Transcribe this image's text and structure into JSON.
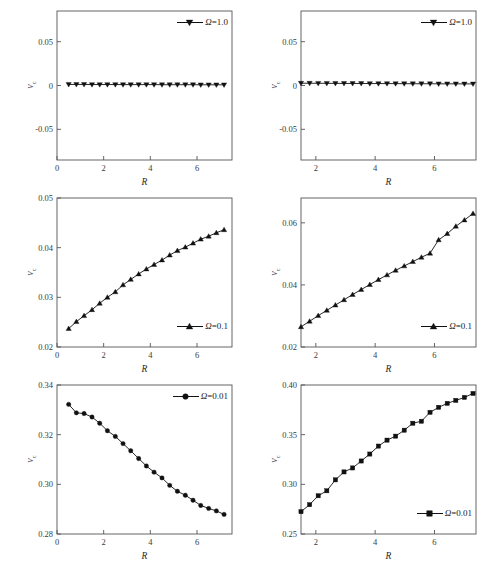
{
  "figure": {
    "panel_count": 6,
    "columns": 2,
    "rows": 3
  },
  "axes": {
    "xlabel": "R",
    "ylabel_main": "v",
    "ylabel_sub": "c"
  },
  "chart_data": [
    {
      "id": "top-left",
      "type": "line",
      "title": "",
      "xlabel": "R",
      "ylabel": "v_c",
      "xlim": [
        0,
        7.5
      ],
      "ylim": [
        -0.085,
        0.085
      ],
      "xticks": [
        0,
        2,
        4,
        6
      ],
      "xticklabels": [
        "0",
        "2",
        "4",
        "6"
      ],
      "yticks": [
        -0.05,
        0,
        0.05
      ],
      "yticklabels": [
        "-0.05",
        "0",
        "0.05"
      ],
      "grid": false,
      "legend_position": "top-right",
      "series": [
        {
          "name": "Ω=1.0",
          "marker": "triangle-down",
          "x": [
            0.5,
            0.83,
            1.16,
            1.5,
            1.83,
            2.16,
            2.5,
            2.83,
            3.16,
            3.5,
            3.83,
            4.16,
            4.5,
            4.83,
            5.16,
            5.5,
            5.83,
            6.16,
            6.5,
            6.83,
            7.16
          ],
          "y": [
            0.0012,
            0.0012,
            0.0012,
            0.0011,
            0.0011,
            0.0011,
            0.0011,
            0.001,
            0.001,
            0.001,
            0.001,
            0.001,
            0.0009,
            0.0009,
            0.0009,
            0.0009,
            0.0009,
            0.0008,
            0.0008,
            0.0008,
            0.0008
          ]
        }
      ]
    },
    {
      "id": "top-right",
      "type": "line",
      "title": "",
      "xlabel": "R",
      "ylabel": "v_c",
      "xlim": [
        1.5,
        7.4
      ],
      "ylim": [
        -0.085,
        0.085
      ],
      "xticks": [
        2,
        4,
        6
      ],
      "xticklabels": [
        "2",
        "4",
        "6"
      ],
      "yticks": [
        -0.05,
        0,
        0.05
      ],
      "yticklabels": [
        "-0.05",
        "0",
        "0.05"
      ],
      "grid": false,
      "legend_position": "top-right",
      "series": [
        {
          "name": "Ω=1.0",
          "marker": "triangle-down",
          "x": [
            1.5,
            1.79,
            2.08,
            2.37,
            2.66,
            2.95,
            3.24,
            3.53,
            3.82,
            4.11,
            4.4,
            4.69,
            4.98,
            5.27,
            5.56,
            5.85,
            6.14,
            6.43,
            6.72,
            7.01,
            7.3
          ],
          "y": [
            0.0026,
            0.0026,
            0.0025,
            0.0025,
            0.0024,
            0.0024,
            0.0023,
            0.0023,
            0.0022,
            0.0022,
            0.0022,
            0.0021,
            0.0021,
            0.002,
            0.002,
            0.002,
            0.0019,
            0.0019,
            0.0019,
            0.0018,
            0.0018
          ]
        }
      ]
    },
    {
      "id": "middle-left",
      "type": "line",
      "title": "",
      "xlabel": "R",
      "ylabel": "v_c",
      "xlim": [
        0,
        7.5
      ],
      "ylim": [
        0.02,
        0.05
      ],
      "xticks": [
        0,
        2,
        4,
        6
      ],
      "xticklabels": [
        "0",
        "2",
        "4",
        "6"
      ],
      "yticks": [
        0.02,
        0.03,
        0.04,
        0.05
      ],
      "yticklabels": [
        "0.02",
        "0.03",
        "0.04",
        "0.05"
      ],
      "grid": false,
      "legend_position": "bottom-right",
      "series": [
        {
          "name": "Ω=0.1",
          "marker": "triangle-up",
          "x": [
            0.5,
            0.83,
            1.16,
            1.5,
            1.83,
            2.16,
            2.5,
            2.83,
            3.16,
            3.5,
            3.83,
            4.16,
            4.5,
            4.83,
            5.16,
            5.5,
            5.83,
            6.16,
            6.5,
            6.83,
            7.16
          ],
          "y": [
            0.0237,
            0.0251,
            0.0263,
            0.0275,
            0.0288,
            0.03,
            0.0311,
            0.0325,
            0.0336,
            0.0347,
            0.0357,
            0.0366,
            0.0375,
            0.0385,
            0.0394,
            0.0401,
            0.0409,
            0.0417,
            0.0423,
            0.043,
            0.0436
          ]
        }
      ]
    },
    {
      "id": "middle-right",
      "type": "line",
      "title": "",
      "xlabel": "R",
      "ylabel": "v_c",
      "xlim": [
        1.5,
        7.4
      ],
      "ylim": [
        0.02,
        0.068
      ],
      "xticks": [
        2,
        4,
        6
      ],
      "xticklabels": [
        "2",
        "4",
        "6"
      ],
      "yticks": [
        0.02,
        0.04,
        0.06
      ],
      "yticklabels": [
        "0.02",
        "0.04",
        "0.06"
      ],
      "grid": false,
      "legend_position": "bottom-right",
      "series": [
        {
          "name": "Ω=0.1",
          "marker": "triangle-up",
          "x": [
            1.5,
            1.79,
            2.08,
            2.37,
            2.66,
            2.95,
            3.24,
            3.53,
            3.82,
            4.11,
            4.4,
            4.69,
            4.98,
            5.27,
            5.56,
            5.85,
            6.14,
            6.43,
            6.72,
            7.01,
            7.3
          ],
          "y": [
            0.0265,
            0.0283,
            0.0301,
            0.0318,
            0.0335,
            0.0352,
            0.0369,
            0.0385,
            0.0401,
            0.0417,
            0.0432,
            0.0447,
            0.0461,
            0.0475,
            0.0489,
            0.0502,
            0.0545,
            0.0565,
            0.0589,
            0.0609,
            0.063
          ]
        }
      ]
    },
    {
      "id": "bottom-left",
      "type": "line",
      "title": "",
      "xlabel": "R",
      "ylabel": "v_c",
      "xlim": [
        0,
        7.5
      ],
      "ylim": [
        0.28,
        0.34
      ],
      "xticks": [
        0,
        2,
        4,
        6
      ],
      "xticklabels": [
        "0",
        "2",
        "4",
        "6"
      ],
      "yticks": [
        0.28,
        0.3,
        0.32,
        0.34
      ],
      "yticklabels": [
        "0.28",
        "0.30",
        "0.32",
        "0.34"
      ],
      "grid": false,
      "legend_position": "top-right",
      "series": [
        {
          "name": "Ω=0.01",
          "marker": "circle",
          "x": [
            0.5,
            0.83,
            1.16,
            1.5,
            1.83,
            2.16,
            2.5,
            2.83,
            3.16,
            3.5,
            3.83,
            4.16,
            4.5,
            4.83,
            5.16,
            5.5,
            5.83,
            6.16,
            6.5,
            6.83,
            7.16
          ],
          "y": [
            0.3322,
            0.3288,
            0.3285,
            0.3271,
            0.3246,
            0.3216,
            0.3193,
            0.3164,
            0.3135,
            0.3104,
            0.3074,
            0.3049,
            0.3026,
            0.2996,
            0.2972,
            0.2956,
            0.2936,
            0.2915,
            0.2903,
            0.2893,
            0.2879
          ]
        }
      ]
    },
    {
      "id": "bottom-right",
      "type": "line",
      "title": "",
      "xlabel": "R",
      "ylabel": "v_c",
      "xlim": [
        1.5,
        7.4
      ],
      "ylim": [
        0.25,
        0.4
      ],
      "xticks": [
        2,
        4,
        6
      ],
      "xticklabels": [
        "2",
        "4",
        "6"
      ],
      "yticks": [
        0.25,
        0.3,
        0.35,
        0.4
      ],
      "yticklabels": [
        "0.25",
        "0.30",
        "0.35",
        "0.40"
      ],
      "grid": false,
      "legend_position": "bottom-right",
      "series": [
        {
          "name": "Ω=0.01",
          "marker": "square",
          "x": [
            1.5,
            1.79,
            2.08,
            2.37,
            2.66,
            2.95,
            3.24,
            3.53,
            3.82,
            4.11,
            4.4,
            4.69,
            4.98,
            5.27,
            5.56,
            5.85,
            6.14,
            6.43,
            6.72,
            7.01,
            7.3
          ],
          "y": [
            0.2725,
            0.2795,
            0.2885,
            0.2935,
            0.3045,
            0.3125,
            0.3165,
            0.3235,
            0.3305,
            0.3385,
            0.3445,
            0.3485,
            0.3545,
            0.3615,
            0.3635,
            0.3725,
            0.3775,
            0.3815,
            0.3845,
            0.3875,
            0.3915
          ]
        }
      ]
    }
  ]
}
